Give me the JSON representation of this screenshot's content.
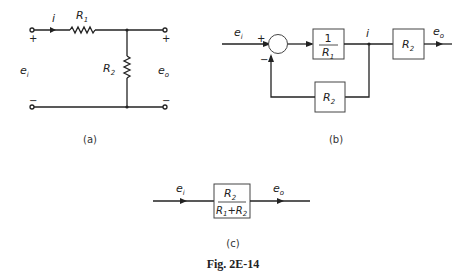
{
  "figure": {
    "caption": "Fig. 2E-14"
  },
  "panel_a": {
    "label": "(a)",
    "current": "i",
    "r1": "R",
    "r1_sub": "1",
    "r2": "R",
    "r2_sub": "2",
    "input": "e",
    "input_sub": "i",
    "output": "e",
    "output_sub": "o",
    "plus": "+",
    "minus": "−"
  },
  "panel_b": {
    "label": "(b)",
    "input": "e",
    "input_sub": "i",
    "output": "e",
    "output_sub": "o",
    "sum_plus": "+",
    "sum_minus": "−",
    "forward_block_num": "1",
    "forward_block_den": "R",
    "forward_block_den_sub": "1",
    "current": "i",
    "output_block": "R",
    "output_block_sub": "2",
    "feedback_block": "R",
    "feedback_block_sub": "2"
  },
  "panel_c": {
    "label": "(c)",
    "input": "e",
    "input_sub": "i",
    "output": "e",
    "output_sub": "o",
    "block_num": "R",
    "block_num_sub": "2",
    "block_den_a": "R",
    "block_den_a_sub": "1",
    "block_den_plus": "+",
    "block_den_b": "R",
    "block_den_b_sub": "2"
  }
}
